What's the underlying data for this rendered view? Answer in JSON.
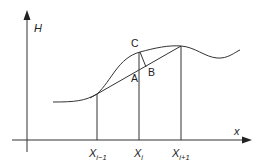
{
  "diagram": {
    "colors": {
      "stroke": "#333333",
      "text": "#222222",
      "background": "#ffffff"
    },
    "axes": {
      "y_label": "H",
      "x_label": "x"
    },
    "points": {
      "A": "A",
      "B": "B",
      "C": "C"
    },
    "ticks": [
      {
        "base": "X",
        "sub": "i−1"
      },
      {
        "base": "X",
        "sub": "i"
      },
      {
        "base": "X",
        "sub": "i+1"
      }
    ]
  }
}
